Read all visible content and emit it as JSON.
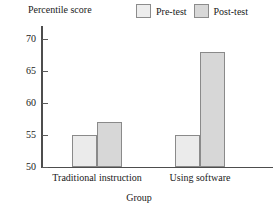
{
  "chart_data": {
    "type": "bar",
    "title": "",
    "xlabel": "Group",
    "ylabel": "Percentile score",
    "categories": [
      "Traditional instruction",
      "Using software"
    ],
    "series": [
      {
        "name": "Pre-test",
        "values": [
          55,
          55
        ]
      },
      {
        "name": "Post-test",
        "values": [
          57,
          68
        ]
      }
    ],
    "ylim": [
      50,
      72
    ],
    "yticks": [
      50,
      55,
      60,
      65,
      70
    ],
    "ytick_labels": [
      "50",
      "55",
      "60",
      "65",
      "70"
    ],
    "grid": false,
    "legend_position": "top-right",
    "colors": {
      "pre_fill": "#ebebeb",
      "post_fill": "#d7d7d7",
      "bar_border": "#8a8a8a",
      "axis": "#4d4d4d",
      "text": "#1a1a1a",
      "background": "#ffffff"
    }
  },
  "legend": {
    "entries": [
      {
        "label": "Pre-test"
      },
      {
        "label": "Post-test"
      }
    ]
  },
  "axes": {
    "y_title": "Percentile score",
    "x_title": "Group"
  }
}
